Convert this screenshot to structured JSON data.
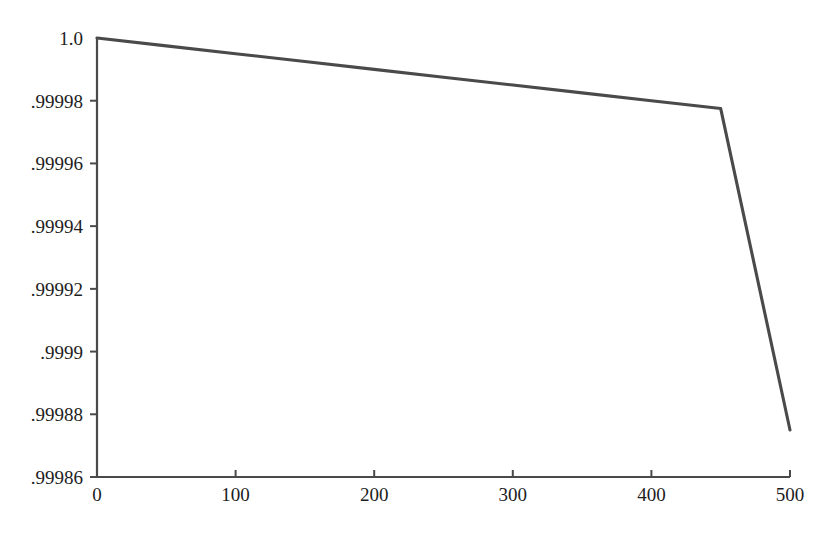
{
  "chart_data": {
    "type": "line",
    "title": "",
    "subtitle": "",
    "xlabel": "",
    "ylabel": "",
    "xlim": [
      0,
      500
    ],
    "ylim": [
      0.99986,
      1.0
    ],
    "grid": false,
    "legend": null,
    "x_ticks": [
      0,
      100,
      200,
      300,
      400,
      500
    ],
    "x_tick_labels": [
      "0",
      "100",
      "200",
      "300",
      "400",
      "500"
    ],
    "y_ticks": [
      1.0,
      0.99998,
      0.99996,
      0.99994,
      0.99992,
      0.9999,
      0.99988,
      0.99986
    ],
    "y_tick_labels": [
      "1.0",
      ".99998",
      ".99996",
      ".99994",
      ".99992",
      ".9999",
      ".99988",
      ".99986"
    ],
    "series": [
      {
        "name": "curve",
        "color": "#4a4a4a",
        "x": [
          0,
          50,
          100,
          150,
          200,
          250,
          300,
          350,
          400,
          450,
          500
        ],
        "y": [
          1.0,
          0.9999975,
          0.999995,
          0.9999925,
          0.99999,
          0.9999875,
          0.999985,
          0.9999825,
          0.99998,
          0.9999775,
          0.999875
        ]
      }
    ],
    "annotations": []
  },
  "axes": {
    "y_axis_name": "y-axis",
    "x_axis_name": "x-axis"
  }
}
